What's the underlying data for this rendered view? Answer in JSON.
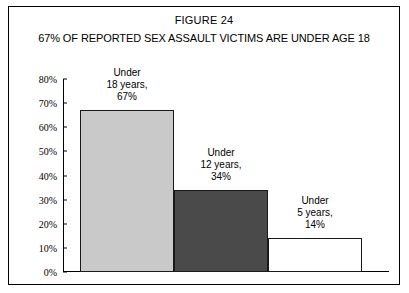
{
  "figure": {
    "number": "FIGURE 24",
    "subtitle": "67% OF REPORTED SEX ASSAULT VICTIMS ARE UNDER AGE 18"
  },
  "chart_data": {
    "type": "bar",
    "title": "67% OF REPORTED SEX ASSAULT VICTIMS ARE UNDER AGE 18",
    "xlabel": "",
    "ylabel": "",
    "ylim": [
      0,
      80
    ],
    "ytick_labels": [
      "80%",
      "70%",
      "60%",
      "50%",
      "40%",
      "30%",
      "20%",
      "10%",
      "0%"
    ],
    "ytick_values": [
      80,
      70,
      60,
      50,
      40,
      30,
      20,
      10,
      0
    ],
    "grid": false,
    "legend": "none",
    "categories": [
      "Under 18 years",
      "Under 12 years",
      "Under 5 years"
    ],
    "values": [
      67,
      34,
      14
    ],
    "bar_colors": [
      "#c9c9c9",
      "#4a4a4a",
      "#ffffff"
    ],
    "data_labels": [
      "67%",
      "34%",
      "14%"
    ],
    "annotations": [
      {
        "line1": "Under",
        "line2": "18 years,",
        "line3": "67%"
      },
      {
        "line1": "Under",
        "line2": "12 years,",
        "line3": "34%"
      },
      {
        "line1": "Under",
        "line2": "5 years,",
        "line3": "14%"
      }
    ]
  }
}
